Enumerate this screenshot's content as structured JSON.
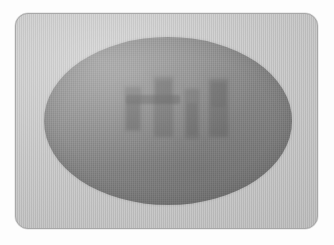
{
  "image": {
    "kind": "radiographic-scan",
    "description": "Grayscale radiographic style scan of an oval specimen showing four vertical dense bar-shaped marks and a horizontal dense band",
    "alt_text": "Oval gray specimen on a light gray plate with four dark vertical marks",
    "width": 334,
    "height": 245
  },
  "colors": {
    "page_background": "#fdfdfd",
    "plate_fill": "#c2c2c2",
    "plate_border": "#a8a8a8",
    "specimen_light": "#8f8f8f",
    "specimen_mid": "#838383",
    "specimen_dark": "#7a7a7a",
    "mark_dark": "#484848",
    "mark_mid": "#5f5f5f",
    "band_dark": "#424242"
  },
  "plate": {
    "name": "specimen-plate",
    "x": 15,
    "y": 13,
    "width": 303,
    "height": 216,
    "corner_radius": 13
  },
  "specimen": {
    "name": "oval-specimen",
    "shape": "ellipse",
    "center_x": 167,
    "center_y": 120,
    "radius_x": 124,
    "radius_y": 84
  },
  "marks": {
    "count": 4,
    "horizontal_bands": 1,
    "items": [
      {
        "id": "mark-1",
        "label": "vertical-mark-1",
        "x": 81,
        "y": 50,
        "width": 16,
        "height": 44,
        "opacity": 0.5
      },
      {
        "id": "mark-2",
        "label": "vertical-mark-2",
        "x": 110,
        "y": 40,
        "width": 19,
        "height": 60,
        "opacity": 0.55
      },
      {
        "id": "mark-3",
        "label": "vertical-mark-3",
        "x": 141,
        "y": 52,
        "width": 14,
        "height": 50,
        "opacity": 0.48
      },
      {
        "id": "mark-4",
        "label": "vertical-mark-4",
        "x": 165,
        "y": 42,
        "width": 19,
        "height": 58,
        "opacity": 0.55
      }
    ],
    "bands": [
      {
        "id": "band-1",
        "label": "horizontal-band-1",
        "x": 82,
        "y": 58,
        "width": 54,
        "height": 9,
        "opacity": 0.58
      }
    ]
  }
}
